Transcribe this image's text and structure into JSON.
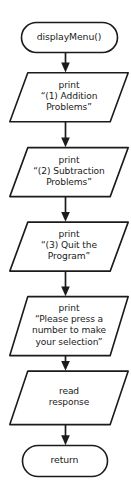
{
  "diagram": {
    "type": "flowchart",
    "background_color": "#ffffff",
    "line_color": "#1b1b1b",
    "text_color": "#1a1a1a",
    "nodes": [
      {
        "id": "start",
        "shape": "terminal",
        "text": "displayMenu()"
      },
      {
        "id": "print1",
        "shape": "parallelogram",
        "text": "print\n“(1) Addition\nProblems”"
      },
      {
        "id": "print2",
        "shape": "parallelogram",
        "text": "print\n“(2) Subtraction\nProblems”"
      },
      {
        "id": "print3",
        "shape": "parallelogram",
        "text": "print\n“(3) Quit the\nProgram”"
      },
      {
        "id": "print4",
        "shape": "parallelogram",
        "text": "print\n“Please press a\nnumber to make\nyour selection”"
      },
      {
        "id": "read",
        "shape": "parallelogram",
        "text": "read\nresponse"
      },
      {
        "id": "end",
        "shape": "terminal",
        "text": "return"
      }
    ],
    "connectors": [
      {
        "id": "arrow-start-print1",
        "from": "start",
        "to": "print1"
      },
      {
        "id": "arrow-print1-print2",
        "from": "print1",
        "to": "print2"
      },
      {
        "id": "arrow-print2-print3",
        "from": "print2",
        "to": "print3"
      },
      {
        "id": "arrow-print3-print4",
        "from": "print3",
        "to": "print4"
      },
      {
        "id": "arrow-print4-read",
        "from": "print4",
        "to": "read"
      },
      {
        "id": "arrow-read-end",
        "from": "read",
        "to": "end"
      }
    ]
  }
}
